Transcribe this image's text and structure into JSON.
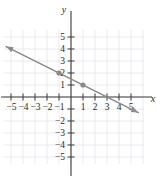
{
  "figure": {
    "kind": "coordinate-plane-line-graph",
    "axis_name_y": "y",
    "axis_name_x": "x"
  },
  "colors": {
    "line": "#8a8a8a",
    "axis": "#3a3a3a",
    "grid": "#e2e2e8",
    "point": "#8a8a8a",
    "label": "#2b2b2b",
    "background": "#ffffff"
  },
  "chart_data": {
    "type": "line",
    "title": "",
    "xlabel": "x",
    "ylabel": "y",
    "xlim": [
      -5.8,
      6.2
    ],
    "ylim": [
      -5.8,
      5.8
    ],
    "grid": true,
    "legend": "none",
    "x_ticks": [
      -5,
      -4,
      -3,
      -2,
      -1,
      1,
      2,
      3,
      4,
      5
    ],
    "y_ticks": [
      -5,
      -4,
      -3,
      -2,
      -1,
      1,
      2,
      3,
      4,
      5
    ],
    "x_tick_labels": [
      "−5",
      "−4",
      "−3",
      "−2",
      "−1",
      "1",
      "2",
      "3",
      "4",
      "5"
    ],
    "y_tick_labels": [
      "−5",
      "−4",
      "−3",
      "−2",
      "1",
      "2",
      "3",
      "4",
      "5"
    ],
    "x_tick_labels_shown": [
      "−5",
      "−4",
      "−3",
      "−2",
      "−1",
      "1",
      "2",
      "3",
      "4",
      "5"
    ],
    "y_tick_labels_shown": [
      "5",
      "4",
      "3",
      "2",
      "1",
      "−2",
      "−3",
      "−4",
      "−5"
    ],
    "series": [
      {
        "name": "line",
        "kind": "line",
        "slope": -0.5,
        "intercept": 1.5,
        "equation": "y = -0.5x + 1.5",
        "arrows": "both",
        "endpoints": [
          {
            "x": -5.4,
            "y": 4.2
          },
          {
            "x": 5.6,
            "y": -1.3
          }
        ]
      },
      {
        "name": "plotted-points",
        "kind": "scatter",
        "points": [
          {
            "x": -1,
            "y": 2
          },
          {
            "x": 1,
            "y": 1
          }
        ]
      }
    ]
  },
  "ticks": {
    "x_neg": [
      {
        "value": -5,
        "label": "−5"
      },
      {
        "value": -4,
        "label": "−4"
      },
      {
        "value": -3,
        "label": "−3"
      },
      {
        "value": -2,
        "label": "−2"
      },
      {
        "value": -1,
        "label": "−1"
      }
    ],
    "x_pos": [
      {
        "value": 1,
        "label": "1"
      },
      {
        "value": 2,
        "label": "2"
      },
      {
        "value": 3,
        "label": "3"
      },
      {
        "value": 4,
        "label": "4"
      },
      {
        "value": 5,
        "label": "5"
      }
    ],
    "y_pos": [
      {
        "value": 5,
        "label": "5"
      },
      {
        "value": 4,
        "label": "4"
      },
      {
        "value": 3,
        "label": "3"
      },
      {
        "value": 2,
        "label": "2"
      },
      {
        "value": 1,
        "label": "1"
      }
    ],
    "y_neg": [
      {
        "value": -2,
        "label": "−2"
      },
      {
        "value": -3,
        "label": "−3"
      },
      {
        "value": -4,
        "label": "−4"
      },
      {
        "value": -5,
        "label": "−5"
      }
    ]
  },
  "geometry": {
    "origin_x": 71,
    "origin_y": 97,
    "unit_px": 12
  }
}
